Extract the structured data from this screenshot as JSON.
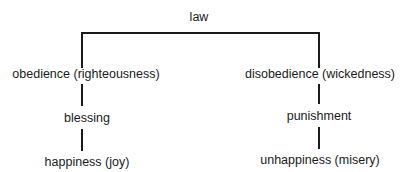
{
  "diagram": {
    "root": {
      "label": "law"
    },
    "left_branch": {
      "level1": "obedience (righteousness)",
      "level2": "blessing",
      "level3": "happiness (joy)"
    },
    "right_branch": {
      "level1": "disobedience (wickedness)",
      "level2": "punishment",
      "level3": "unhappiness (misery)"
    },
    "line_color": "#1a1a1a"
  }
}
